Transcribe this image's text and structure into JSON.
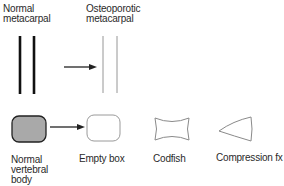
{
  "top_row": {
    "normal_metacarpal_label": [
      "Normal",
      "metacarpal"
    ],
    "osteoporotic_metacarpal_label": [
      "Osteoporotic",
      "metacarpal"
    ]
  },
  "bottom_row": {
    "normal_vertebral_body_label": [
      "Normal",
      "vertebral",
      "body"
    ],
    "empty_box_label": "Empty box",
    "codfish_label": "Codfish",
    "compression_fx_label": "Compression fx"
  },
  "colors": {
    "line": "#111111",
    "outline": "#8a8a8a",
    "fill_gray": "#a9a9a9",
    "text": "#2a2a2a"
  }
}
